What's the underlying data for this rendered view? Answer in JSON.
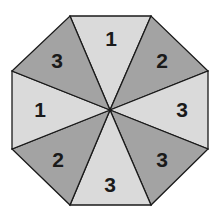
{
  "diagram": {
    "type": "spinner",
    "shape": "octagon",
    "colors": {
      "light": "#dadada",
      "dark": "#a3a3a3",
      "stroke": "#1a1a1a"
    },
    "sections": [
      {
        "position": "top",
        "label": "1",
        "shade": "light"
      },
      {
        "position": "top-right",
        "label": "2",
        "shade": "dark"
      },
      {
        "position": "right",
        "label": "3",
        "shade": "light"
      },
      {
        "position": "bottom-right",
        "label": "3",
        "shade": "dark"
      },
      {
        "position": "bottom",
        "label": "3",
        "shade": "light"
      },
      {
        "position": "bottom-left",
        "label": "2",
        "shade": "dark"
      },
      {
        "position": "left",
        "label": "1",
        "shade": "light"
      },
      {
        "position": "top-left",
        "label": "3",
        "shade": "dark"
      }
    ]
  }
}
